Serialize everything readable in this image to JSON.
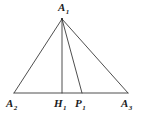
{
  "figure": {
    "background_color": "#ffffff",
    "stroke_color": "#3a3a3a",
    "label_color": "#1b1b1b",
    "width": 142,
    "height": 122
  },
  "labels": {
    "apex": {
      "base": "A",
      "sub": "1",
      "text": "A1"
    },
    "base_left": {
      "base": "A",
      "sub": "2",
      "text": "A2"
    },
    "foot_altitude": {
      "base": "H",
      "sub": "1",
      "text": "H1"
    },
    "foot_cevian": {
      "base": "P",
      "sub": "1",
      "text": "P1"
    },
    "base_right": {
      "base": "A",
      "sub": "3",
      "text": "A3"
    }
  },
  "chart_data": {
    "type": "scatter",
    "xlabel": "",
    "ylabel": "",
    "xlim": [
      0,
      142
    ],
    "ylim": [
      0,
      122
    ],
    "grid": false,
    "legend": "none",
    "points": [
      {
        "name": "A1",
        "x": 62,
        "y": 19
      },
      {
        "name": "A2",
        "x": 14,
        "y": 93
      },
      {
        "name": "H1",
        "x": 62,
        "y": 93
      },
      {
        "name": "P1",
        "x": 82,
        "y": 93
      },
      {
        "name": "A3",
        "x": 128,
        "y": 93
      }
    ],
    "segments": [
      {
        "name": "side-A1-A2",
        "from": "A1",
        "to": "A2"
      },
      {
        "name": "side-A1-A3",
        "from": "A1",
        "to": "A3"
      },
      {
        "name": "base-A2-A3",
        "from": "A2",
        "to": "A3"
      },
      {
        "name": "altitude-A1-H1",
        "from": "A1",
        "to": "H1"
      },
      {
        "name": "cevian-A1-P1",
        "from": "A1",
        "to": "P1"
      }
    ]
  }
}
